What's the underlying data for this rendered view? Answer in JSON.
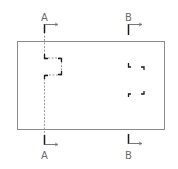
{
  "drawing": {
    "type": "engineering-section-view",
    "sections": [
      {
        "id": "A",
        "top_label": "A",
        "bottom_label": "A"
      },
      {
        "id": "B",
        "top_label": "B",
        "bottom_label": "B"
      }
    ],
    "colors": {
      "outline": "#8a8a8a",
      "cutting_line": "#1a1a1a",
      "hidden_line": "#9a9a9a",
      "label": "#6a6a6a",
      "background": "#ffffff"
    }
  }
}
